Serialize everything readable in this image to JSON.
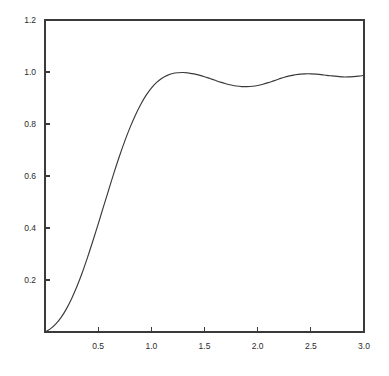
{
  "chart_data": {
    "type": "line",
    "title": "",
    "subtitle": "",
    "xlabel": "",
    "ylabel": "",
    "xlim": [
      0.0,
      3.0
    ],
    "ylim": [
      0.0,
      1.2
    ],
    "grid": false,
    "legend": null,
    "legend_position": "none",
    "annotations": [],
    "line_color": "#3a3a3a",
    "axis_color": "#3a3a3a",
    "background_color": "#ffffff",
    "x_ticks": [
      0.5,
      1.0,
      1.5,
      2.0,
      2.5,
      3.0
    ],
    "x_tick_labels": [
      "0.5",
      "1.0",
      "1.5",
      "2.0",
      "2.5",
      "3.0"
    ],
    "y_ticks": [
      0.2,
      0.4,
      0.6,
      0.8,
      1.0,
      1.2
    ],
    "y_tick_labels": [
      "0.2",
      "0.4",
      "0.6",
      "0.8",
      "1.0",
      "1.2"
    ],
    "tick_direction": "in",
    "series": [
      {
        "name": "step-response",
        "x": [
          0.0,
          0.05,
          0.1,
          0.15,
          0.2,
          0.25,
          0.3,
          0.35,
          0.4,
          0.45,
          0.5,
          0.55,
          0.6,
          0.65,
          0.7,
          0.75,
          0.8,
          0.85,
          0.9,
          0.95,
          1.0,
          1.05,
          1.1,
          1.15,
          1.2,
          1.25,
          1.3,
          1.35,
          1.4,
          1.45,
          1.5,
          1.55,
          1.6,
          1.65,
          1.7,
          1.75,
          1.8,
          1.85,
          1.9,
          1.95,
          2.0,
          2.05,
          2.1,
          2.15,
          2.2,
          2.25,
          2.3,
          2.35,
          2.4,
          2.45,
          2.5,
          2.55,
          2.6,
          2.65,
          2.7,
          2.75,
          2.8,
          2.85,
          2.9,
          2.95,
          3.0
        ],
        "y": [
          0.0,
          0.012,
          0.03,
          0.055,
          0.088,
          0.128,
          0.175,
          0.228,
          0.287,
          0.35,
          0.415,
          0.482,
          0.548,
          0.614,
          0.676,
          0.734,
          0.787,
          0.834,
          0.875,
          0.91,
          0.938,
          0.96,
          0.976,
          0.987,
          0.994,
          0.997,
          0.998,
          0.996,
          0.993,
          0.988,
          0.982,
          0.975,
          0.968,
          0.961,
          0.955,
          0.95,
          0.946,
          0.944,
          0.944,
          0.945,
          0.948,
          0.953,
          0.959,
          0.966,
          0.973,
          0.98,
          0.985,
          0.989,
          0.992,
          0.993,
          0.993,
          0.992,
          0.99,
          0.987,
          0.985,
          0.983,
          0.981,
          0.981,
          0.982,
          0.984,
          0.987
        ]
      }
    ]
  },
  "axes": {
    "y_axis_name": "y-axis",
    "x_axis_name": "x-axis"
  }
}
